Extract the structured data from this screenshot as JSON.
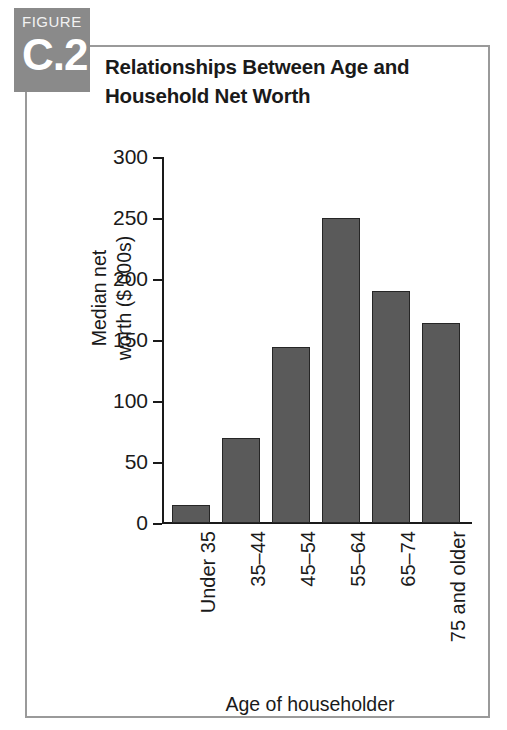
{
  "badge": {
    "kicker": "FIGURE",
    "number": "C.2",
    "color": "#8a8a8a"
  },
  "title": {
    "line1": "Relationships Between Age and",
    "line2": "Household Net Worth"
  },
  "frame": {
    "border_color": "#9a9a9a"
  },
  "chart_data": {
    "type": "bar",
    "title": "Relationships Between Age and Household Net Worth",
    "subtitle": "",
    "categories": [
      "Under 35",
      "35–44",
      "45–54",
      "55–64",
      "65–74",
      "75 and older"
    ],
    "values": [
      15,
      70,
      144,
      250,
      190,
      164
    ],
    "xlabel": "Age of householder",
    "ylabel_line1": "Median net",
    "ylabel_line2": "worth ($ 000s)",
    "ylabel": "Median net worth ($ 000s)",
    "ylim": [
      0,
      300
    ],
    "yticks": [
      0,
      50,
      100,
      150,
      200,
      250,
      300
    ],
    "ytick_labels": [
      "0",
      "50",
      "100",
      "150",
      "200",
      "250",
      "300"
    ],
    "grid": false,
    "legend": false,
    "bar_color": "#5a5a5a",
    "bar_edge_color": "#262626",
    "xtick_rotation": -90
  }
}
